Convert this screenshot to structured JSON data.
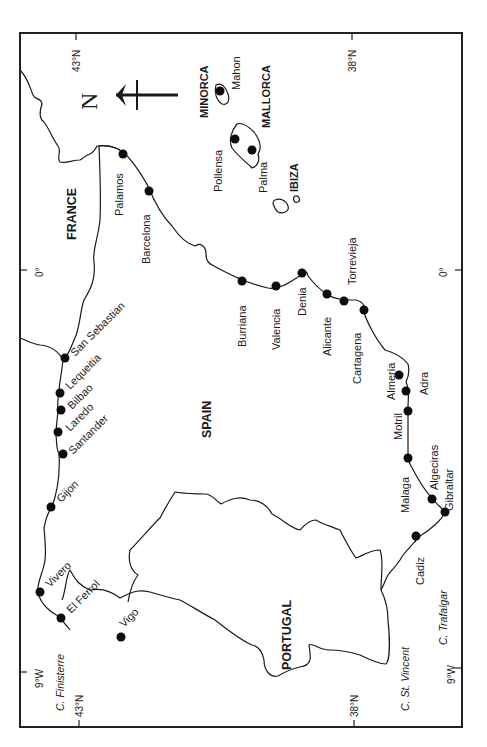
{
  "map": {
    "frame_color": "#222222",
    "ticks": {
      "top": [
        {
          "label": "43°N"
        },
        {
          "label": "38°N"
        }
      ],
      "bottom": [
        {
          "label": "43°N"
        },
        {
          "label": "38°N"
        }
      ],
      "left": [
        {
          "label": "0°"
        },
        {
          "label": "9°W"
        }
      ],
      "right": [
        {
          "label": "0°"
        },
        {
          "label": "9°W"
        }
      ]
    },
    "north_arrow": {
      "label": "N"
    },
    "countries": [
      {
        "name": "FRANCE"
      },
      {
        "name": "SPAIN"
      },
      {
        "name": "PORTUGAL"
      }
    ],
    "islands": [
      {
        "name": "MINORCA"
      },
      {
        "name": "MALLORCA"
      },
      {
        "name": "IBIZA"
      }
    ],
    "capes": [
      {
        "name": "C. Finisterre"
      },
      {
        "name": "C. St. Vincent"
      },
      {
        "name": "C. Trafalgar"
      }
    ],
    "ports": [
      {
        "name": "Palamos"
      },
      {
        "name": "Barcelona"
      },
      {
        "name": "Burriana"
      },
      {
        "name": "Valencia"
      },
      {
        "name": "Denia"
      },
      {
        "name": "Alicante"
      },
      {
        "name": "Torrevieja"
      },
      {
        "name": "Cartagena"
      },
      {
        "name": "Almeria"
      },
      {
        "name": "Adra"
      },
      {
        "name": "Motril"
      },
      {
        "name": "Malaga"
      },
      {
        "name": "Algeciras"
      },
      {
        "name": "Gibraltar"
      },
      {
        "name": "Cadiz"
      },
      {
        "name": "Vigo"
      },
      {
        "name": "El Ferrol"
      },
      {
        "name": "Vivero"
      },
      {
        "name": "Gijon"
      },
      {
        "name": "Santander"
      },
      {
        "name": "Laredo"
      },
      {
        "name": "Bilbao"
      },
      {
        "name": "Lequeitia"
      },
      {
        "name": "San Sebastian"
      },
      {
        "name": "Mahon"
      },
      {
        "name": "Pollensa"
      },
      {
        "name": "Palma"
      }
    ]
  }
}
